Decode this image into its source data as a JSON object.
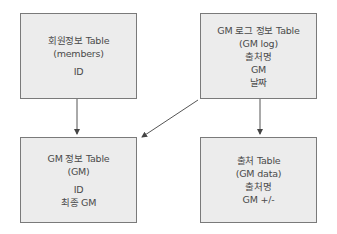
{
  "diagram": {
    "type": "entity-relationship",
    "boxes": [
      {
        "id": "members",
        "title": "회원정보 Table",
        "alias": "(members)",
        "fields": [
          "ID"
        ]
      },
      {
        "id": "gm_log",
        "title": "GM 로그 정보 Table",
        "alias": "(GM log)",
        "fields": [
          "출처명",
          "GM",
          "날짜"
        ]
      },
      {
        "id": "gm",
        "title": "GM 정보 Table",
        "alias": "(GM)",
        "fields": [
          "ID",
          "최종 GM"
        ]
      },
      {
        "id": "gm_data",
        "title": "출처 Table",
        "alias": "(GM data)",
        "fields": [
          "출처명",
          "GM +/-"
        ]
      }
    ],
    "edges": [
      {
        "from": "members",
        "to": "gm"
      },
      {
        "from": "gm_log",
        "to": "gm"
      },
      {
        "from": "gm_log",
        "to": "gm_data"
      }
    ],
    "colors": {
      "box_fill": "#ececec",
      "box_border": "#7a7a7a",
      "arrow": "#555555",
      "text": "#4a4a4a"
    }
  }
}
